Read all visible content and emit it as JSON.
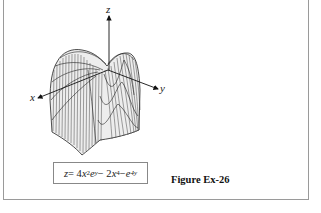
{
  "figure": {
    "label": "Figure Ex-26",
    "formula": {
      "lhs": "z",
      "eq": " = 4",
      "t1_var": "x",
      "t1_exp": "2",
      "t1_e": "e",
      "t1_e_exp": "y",
      "minus1": " − 2",
      "t2_var": "x",
      "t2_exp": "4",
      "minus2": " − ",
      "t3_e": "e",
      "t3_exp": "4y"
    },
    "axes": {
      "x": "x",
      "y": "y",
      "z": "z"
    },
    "plot_type": "3D wireframe surface"
  },
  "colors": {
    "frame": "#9a9a9a",
    "mesh": "#222222",
    "surface": "#f2f2f2"
  }
}
